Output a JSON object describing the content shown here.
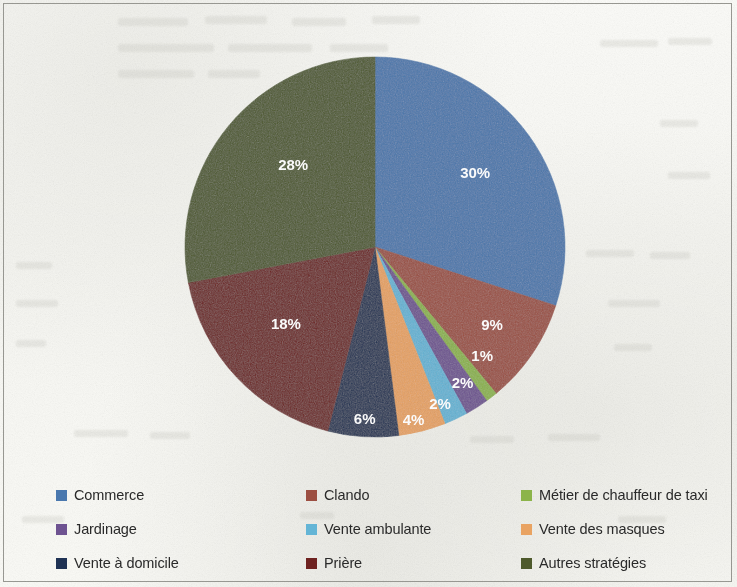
{
  "chart_data": {
    "type": "pie",
    "title": "",
    "subtitle": "",
    "xlabel": "",
    "ylabel": "",
    "start_angle_deg": 0,
    "direction": "clockwise",
    "legend_position": "bottom",
    "grid": false,
    "categories": [
      "Commerce",
      "Clando",
      "Métier de chauffeur de taxi",
      "Jardinage",
      "Vente ambulante",
      "Vente des masques",
      "Vente à domicile",
      "Prière",
      "Autres stratégies"
    ],
    "values": [
      30,
      9,
      1,
      2,
      2,
      4,
      6,
      18,
      28
    ],
    "data_labels": [
      "30%",
      "9%",
      "1%",
      "2%",
      "2%",
      "4%",
      "6%",
      "18%",
      "28%"
    ],
    "colors": [
      "#4a78ae",
      "#9c4f42",
      "#8cb44a",
      "#6e5391",
      "#64b5d6",
      "#e9a362",
      "#1f3254",
      "#6e2220",
      "#4e5a2c"
    ],
    "label_color": "#ffffff",
    "slices": [
      {
        "label": "Commerce",
        "value": 30,
        "data_label": "30%",
        "color": "#4a78ae"
      },
      {
        "label": "Clando",
        "value": 9,
        "data_label": "9%",
        "color": "#9c4f42"
      },
      {
        "label": "Métier de chauffeur de taxi",
        "value": 1,
        "data_label": "1%",
        "color": "#8cb44a"
      },
      {
        "label": "Jardinage",
        "value": 2,
        "data_label": "2%",
        "color": "#6e5391"
      },
      {
        "label": "Vente ambulante",
        "value": 2,
        "data_label": "2%",
        "color": "#64b5d6"
      },
      {
        "label": "Vente des masques",
        "value": 4,
        "data_label": "4%",
        "color": "#e9a362"
      },
      {
        "label": "Vente à domicile",
        "value": 6,
        "data_label": "6%",
        "color": "#1f3254"
      },
      {
        "label": "Prière",
        "value": 18,
        "data_label": "18%",
        "color": "#6e2220"
      },
      {
        "label": "Autres stratégies",
        "value": 28,
        "data_label": "28%",
        "color": "#4e5a2c"
      }
    ]
  },
  "legend": {
    "items": [
      {
        "label": "Commerce",
        "color": "#4a78ae"
      },
      {
        "label": "Clando",
        "color": "#9c4f42"
      },
      {
        "label": "Métier de chauffeur de taxi",
        "color": "#8cb44a"
      },
      {
        "label": "Jardinage",
        "color": "#6e5391"
      },
      {
        "label": "Vente ambulante",
        "color": "#64b5d6"
      },
      {
        "label": "Vente des masques",
        "color": "#e9a362"
      },
      {
        "label": "Vente à domicile",
        "color": "#1f3254"
      },
      {
        "label": "Prière",
        "color": "#6e2220"
      },
      {
        "label": "Autres stratégies",
        "color": "#4e5a2c"
      }
    ]
  },
  "figure": {
    "background_color": "#fbfbf8",
    "border_color": "#9a9a94"
  }
}
